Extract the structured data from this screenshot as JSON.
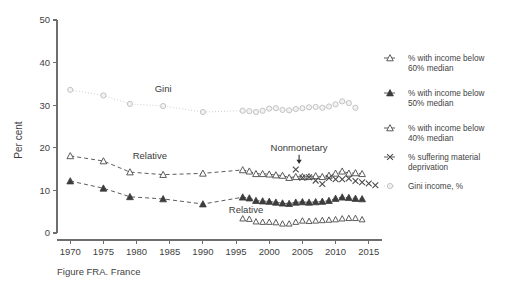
{
  "figure": {
    "caption": "Figure FRA. France",
    "ylabel": "Per cent"
  },
  "chart_data": {
    "type": "line",
    "title": "",
    "subtitle": "",
    "xlabel": "",
    "ylabel": "Per cent",
    "xlim": [
      1968,
      2017
    ],
    "ylim": [
      0,
      50
    ],
    "xticks": [
      1970,
      1975,
      1980,
      1985,
      1990,
      1995,
      2000,
      2005,
      2010,
      2015
    ],
    "yticks": [
      0,
      10,
      20,
      30,
      40,
      50
    ],
    "xtick_labels": [
      "1970",
      "1975",
      "1980",
      "1985",
      "1990",
      "1995",
      "2000",
      "2005",
      "2010",
      "2015"
    ],
    "ytick_labels": [
      "0",
      "10",
      "20",
      "30",
      "40",
      "50"
    ],
    "grid": false,
    "legend_position": "right",
    "annotations": [
      {
        "text": "Gini",
        "x": 1984,
        "y": 33.0,
        "arrow": false
      },
      {
        "text": "Relative",
        "x": 1982,
        "y": 17.3,
        "arrow": false
      },
      {
        "text": "Relative",
        "x": 1996.5,
        "y": 4.7,
        "arrow": false
      },
      {
        "text": "Nonmonetary",
        "x": 2004.5,
        "y": 19.3,
        "arrow": true,
        "arrow_to_y": 16.2
      }
    ],
    "series": [
      {
        "name": "% with income below 60% median",
        "marker": "open-triangle",
        "line": "dashed",
        "color": "#4a4a4a",
        "x": [
          1970,
          1975,
          1979,
          1984,
          1990,
          1996,
          1997,
          1998,
          1999,
          2000,
          2001,
          2002,
          2003,
          2004,
          2005,
          2006,
          2007,
          2008,
          2009,
          2010,
          2011,
          2012,
          2013,
          2014
        ],
        "values": [
          18.1,
          16.9,
          14.3,
          13.7,
          14.0,
          14.8,
          14.5,
          13.9,
          13.9,
          13.8,
          13.6,
          13.5,
          13.0,
          13.2,
          13.2,
          13.2,
          13.4,
          13.2,
          13.5,
          14.0,
          14.5,
          14.0,
          14.1,
          13.9
        ]
      },
      {
        "name": "% with income below 50% median",
        "marker": "filled-triangle",
        "line": "dashed",
        "color": "#3c3c3c",
        "x": [
          1970,
          1975,
          1979,
          1984,
          1990,
          1996,
          1997,
          1998,
          1999,
          2000,
          2001,
          2002,
          2003,
          2004,
          2005,
          2006,
          2007,
          2008,
          2009,
          2010,
          2011,
          2012,
          2013,
          2014
        ],
        "values": [
          12.2,
          10.5,
          8.5,
          8.0,
          6.8,
          8.4,
          8.2,
          7.6,
          7.5,
          7.4,
          7.2,
          7.0,
          6.9,
          7.2,
          7.3,
          7.2,
          7.3,
          7.4,
          7.6,
          8.1,
          8.4,
          8.3,
          8.1,
          8.0
        ]
      },
      {
        "name": "% with income below 40% median",
        "marker": "open-triangle-small",
        "line": "none",
        "color": "#4a4a4a",
        "x": [
          1996,
          1997,
          1998,
          1999,
          2000,
          2001,
          2002,
          2003,
          2004,
          2005,
          2006,
          2007,
          2008,
          2009,
          2010,
          2011,
          2012,
          2013,
          2014
        ],
        "values": [
          3.4,
          3.3,
          2.7,
          2.6,
          2.6,
          2.5,
          2.2,
          2.2,
          2.6,
          2.9,
          2.8,
          2.9,
          3.0,
          3.1,
          3.2,
          3.4,
          3.5,
          3.5,
          3.2
        ]
      },
      {
        "name": "% suffering material deprivation",
        "marker": "x",
        "line": "none",
        "color": "#4a4a4a",
        "x": [
          2004,
          2005,
          2006,
          2007,
          2008,
          2009,
          2010,
          2011,
          2012,
          2013,
          2014,
          2015,
          2016
        ],
        "values": [
          14.9,
          13.0,
          13.1,
          12.3,
          11.5,
          12.9,
          12.6,
          12.6,
          12.8,
          12.2,
          11.9,
          11.6,
          11.2
        ]
      },
      {
        "name": "Gini income, %",
        "marker": "open-circle",
        "line": "dotted",
        "color": "#c8c8c8",
        "x": [
          1970,
          1975,
          1979,
          1984,
          1990,
          1996,
          1997,
          1998,
          1999,
          2000,
          2001,
          2002,
          2003,
          2004,
          2005,
          2006,
          2007,
          2008,
          2009,
          2010,
          2011,
          2012,
          2013
        ],
        "values": [
          33.6,
          32.3,
          30.3,
          29.8,
          28.4,
          28.7,
          28.6,
          28.4,
          28.7,
          29.2,
          29.3,
          28.9,
          28.8,
          29.1,
          29.3,
          29.5,
          29.6,
          29.4,
          29.7,
          30.2,
          30.9,
          30.5,
          29.4
        ]
      }
    ]
  },
  "legend": {
    "items": [
      {
        "label_line1": "% with income below",
        "label_line2": "60% median",
        "marker": "open-triangle",
        "line": "dashed"
      },
      {
        "label_line1": "% with income below",
        "label_line2": "50% median",
        "marker": "filled-triangle",
        "line": "dashed"
      },
      {
        "label_line1": "% with income below",
        "label_line2": "40% median",
        "marker": "open-triangle",
        "line": "dashed"
      },
      {
        "label_line1": "% suffering material",
        "label_line2": "deprivation",
        "marker": "x",
        "line": "dashed"
      },
      {
        "label_line1": "Gini income, %",
        "label_line2": "",
        "marker": "open-circle",
        "line": "dotted"
      }
    ]
  },
  "colors": {
    "axis": "#6e6e6e",
    "text": "#3f3f3f",
    "dark_series": "#3c3c3c",
    "mid_series": "#4a4a4a",
    "gini_series": "#c8c8c8",
    "background": "#ffffff"
  }
}
